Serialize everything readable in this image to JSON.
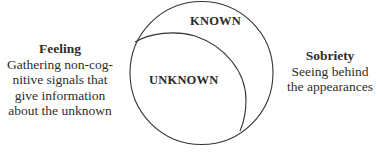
{
  "diagram": {
    "outer_region_label": "KNOWN",
    "inner_region_label": "UNKNOWN",
    "left_annotation": {
      "title": "Feeling",
      "lines": [
        "Gathering non-cog-",
        "nitive signals that",
        "give information",
        "about the unknown"
      ]
    },
    "right_annotation": {
      "title": "Sobriety",
      "lines": [
        "Seeing behind",
        "the appearances"
      ]
    },
    "colors": {
      "stroke": "#333333",
      "text": "#2a2a2a",
      "background": "#ffffff"
    }
  }
}
